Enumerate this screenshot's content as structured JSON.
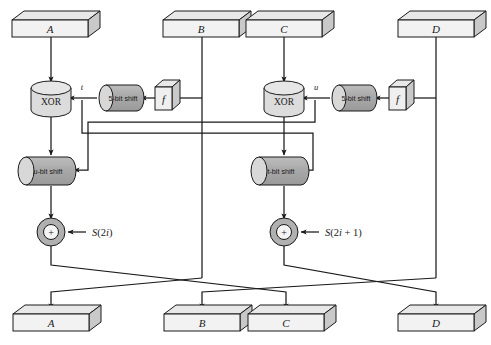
{
  "figure": {
    "background": "#ffffff",
    "line_color": "#1a1a1a",
    "box_face": "#f2f2f2",
    "box_top": "#e8e8e8",
    "box_side": "#c9c9c9",
    "cylinder_fill": "#a8a8a8",
    "cylinder_cap": "#d8d8d8",
    "xor_fill": "#dcdcdc",
    "circle_fill": "#b0b0b0"
  },
  "registers_top": [
    {
      "id": "A",
      "label": "A"
    },
    {
      "id": "B",
      "label": "B"
    },
    {
      "id": "C",
      "label": "C"
    },
    {
      "id": "D",
      "label": "D"
    }
  ],
  "registers_bottom": [
    {
      "id": "A",
      "label": "A"
    },
    {
      "id": "B",
      "label": "B"
    },
    {
      "id": "C",
      "label": "C"
    },
    {
      "id": "D",
      "label": "D"
    }
  ],
  "operations": {
    "xor_left": "XOR",
    "xor_right": "XOR",
    "shift_const_left": "5-bit shift",
    "shift_const_right": "5-bit shift",
    "shift_var_left": "u-bit shift",
    "shift_var_right": "t-bit shift",
    "f_left": "f",
    "f_right": "f",
    "add_left": "+",
    "add_right": "+"
  },
  "wire_labels": {
    "t": "t",
    "u": "u"
  },
  "key_inputs": {
    "left": "S(2i)",
    "right": "S(2i + 1)"
  }
}
